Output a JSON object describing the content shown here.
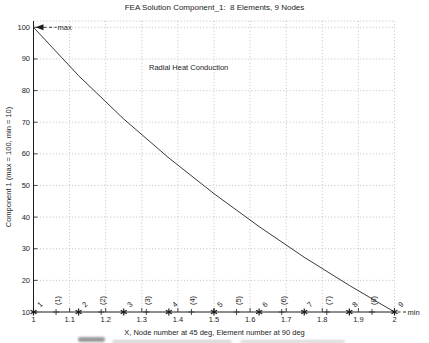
{
  "figure": {
    "background": "#ffffff",
    "ink_color": "#1c1c1c",
    "grid_color": "#bbbbbb",
    "curve_color": "#3a3a3a"
  },
  "chart_data": {
    "type": "line",
    "title": "FEA Solution Component_1:  8 Elements, 9 Nodes",
    "xlabel": "X, Node number at 45 deg, Element number at 90 deg",
    "ylabel": "Component 1 (max = 100, min = 10)",
    "xlim": [
      1,
      2
    ],
    "ylim": [
      10,
      102
    ],
    "grid": "dotted",
    "legend": "none",
    "x_ticks": [
      {
        "value": 1,
        "label": "1"
      },
      {
        "value": 1.1,
        "label": "1.1"
      },
      {
        "value": 1.2,
        "label": "1.2"
      },
      {
        "value": 1.3,
        "label": "1.3"
      },
      {
        "value": 1.4,
        "label": "1.4"
      },
      {
        "value": 1.5,
        "label": "1.5"
      },
      {
        "value": 1.6,
        "label": "1.6"
      },
      {
        "value": 1.7,
        "label": "1.7"
      },
      {
        "value": 1.8,
        "label": "1.8"
      },
      {
        "value": 1.9,
        "label": "1.9"
      },
      {
        "value": 2,
        "label": "2"
      }
    ],
    "y_ticks": [
      {
        "value": 10,
        "label": "10"
      },
      {
        "value": 20,
        "label": "20"
      },
      {
        "value": 30,
        "label": "30"
      },
      {
        "value": 40,
        "label": "40"
      },
      {
        "value": 50,
        "label": "50"
      },
      {
        "value": 60,
        "label": "60"
      },
      {
        "value": 70,
        "label": "70"
      },
      {
        "value": 80,
        "label": "80"
      },
      {
        "value": 90,
        "label": "90"
      },
      {
        "value": 100,
        "label": "100"
      }
    ],
    "series": [
      {
        "name": "FEA nodal solution",
        "x": [
          1,
          1.125,
          1.25,
          1.375,
          1.5,
          1.625,
          1.75,
          1.875,
          2
        ],
        "y": [
          100,
          84.7,
          71.0,
          58.7,
          47.4,
          37.0,
          27.3,
          18.4,
          10
        ]
      }
    ],
    "node_markers": {
      "marker": "asterisk",
      "y_value": 10,
      "x": [
        1,
        1.125,
        1.25,
        1.375,
        1.5,
        1.625,
        1.75,
        1.875,
        2
      ],
      "labels": [
        "1",
        "2",
        "3",
        "4",
        "5",
        "6",
        "7",
        "8",
        "9"
      ]
    },
    "element_markers": {
      "marker": "plus",
      "y_value": 10,
      "x": [
        1.0625,
        1.1875,
        1.3125,
        1.4375,
        1.5625,
        1.6875,
        1.8125,
        1.9375
      ],
      "labels": [
        "(1)",
        "(2)",
        "(3)",
        "(4)",
        "(5)",
        "(6)",
        "(7)",
        "(8)"
      ]
    },
    "annotations": [
      {
        "text": "max",
        "x": 1,
        "y": 100,
        "style": "arrow-left-dashed"
      },
      {
        "text": "min",
        "x": 2,
        "y": 10,
        "style": "dashed"
      },
      {
        "text": "Radial Heat Conduction",
        "x": 1.32,
        "y": 87.3,
        "style": "plain"
      }
    ]
  }
}
